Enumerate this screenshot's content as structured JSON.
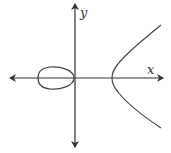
{
  "diagram": {
    "type": "elliptic-curve-graph",
    "axes": {
      "x_label": "x",
      "y_label": "y",
      "color": "#333333"
    },
    "curve": {
      "components": [
        "bounded-loop-left",
        "unbounded-branch-right"
      ],
      "color": "#444444"
    }
  }
}
